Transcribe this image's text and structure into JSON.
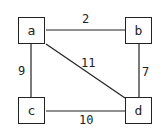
{
  "nodes": [
    {
      "id": "a",
      "label": "a"
    },
    {
      "id": "b",
      "label": "b"
    },
    {
      "id": "c",
      "label": "c"
    },
    {
      "id": "d",
      "label": "d"
    }
  ],
  "edges": [
    {
      "from": "a",
      "to": "b",
      "weight": "2"
    },
    {
      "from": "a",
      "to": "c",
      "weight": "9"
    },
    {
      "from": "a",
      "to": "d",
      "weight": "11"
    },
    {
      "from": "b",
      "to": "d",
      "weight": "7"
    },
    {
      "from": "c",
      "to": "d",
      "weight": "10"
    }
  ]
}
